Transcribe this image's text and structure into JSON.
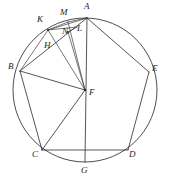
{
  "figure": {
    "width": 171,
    "height": 186,
    "background_color": "#ffffff",
    "stroke_color": "#2b2b2b",
    "circle_color": "#3a3a3a"
  },
  "circle": {
    "name": "circumscribed-circle",
    "center_label": "F",
    "cx": 85,
    "cy": 90,
    "r": 72
  },
  "labels": {
    "A": "A",
    "B": "B",
    "C": "C",
    "D": "D",
    "E": "E",
    "F": "F",
    "G": "G",
    "H": "H",
    "K": "K",
    "L": "L",
    "M": "M",
    "N": "N"
  },
  "points": [
    {
      "id": "A",
      "label": "A",
      "x": 87,
      "y": 18,
      "label_x": 87,
      "label_y": 5,
      "on_circle": true
    },
    {
      "id": "B",
      "label": "B",
      "x": 20,
      "y": 71,
      "label_x": 10,
      "label_y": 66,
      "on_circle": true
    },
    {
      "id": "C",
      "label": "C",
      "x": 42,
      "y": 150,
      "label_x": 34,
      "label_y": 153,
      "on_circle": true
    },
    {
      "id": "D",
      "label": "D",
      "x": 128,
      "y": 150,
      "label_x": 130,
      "label_y": 153,
      "on_circle": true
    },
    {
      "id": "E",
      "label": "E",
      "x": 149,
      "y": 72,
      "label_x": 152,
      "label_y": 67,
      "on_circle": true
    },
    {
      "id": "F",
      "label": "F",
      "x": 85,
      "y": 90,
      "label_x": 90,
      "label_y": 91,
      "on_circle": false
    },
    {
      "id": "G",
      "label": "G",
      "x": 85,
      "y": 162,
      "label_x": 82,
      "label_y": 167,
      "on_circle": true
    },
    {
      "id": "H",
      "label": "H",
      "x": 53,
      "y": 43,
      "label_x": 45,
      "label_y": 44,
      "on_circle": false
    },
    {
      "id": "K",
      "label": "K",
      "x": 48,
      "y": 30,
      "label_x": 39,
      "label_y": 18,
      "on_circle": true
    },
    {
      "id": "L",
      "label": "L",
      "x": 76,
      "y": 28,
      "label_x": 77,
      "label_y": 26,
      "on_circle": false
    },
    {
      "id": "M",
      "label": "M",
      "x": 68,
      "y": 22,
      "label_x": 62,
      "label_y": 11,
      "on_circle": true
    },
    {
      "id": "N",
      "label": "N",
      "x": 68,
      "y": 32,
      "label_x": 63,
      "label_y": 29,
      "on_circle": false
    }
  ],
  "segments": [
    {
      "name": "pentagon-side-ab",
      "from": "A",
      "to": "B"
    },
    {
      "name": "pentagon-side-bc",
      "from": "B",
      "to": "C"
    },
    {
      "name": "pentagon-side-cd",
      "from": "C",
      "to": "D"
    },
    {
      "name": "pentagon-side-de",
      "from": "D",
      "to": "E"
    },
    {
      "name": "pentagon-side-ea",
      "from": "E",
      "to": "A"
    },
    {
      "name": "diameter-ag",
      "from": "A",
      "to": "G"
    },
    {
      "name": "radius-fb",
      "from": "F",
      "to": "B"
    },
    {
      "name": "radius-fc",
      "from": "F",
      "to": "C"
    },
    {
      "name": "radius-fk",
      "from": "F",
      "to": "K"
    },
    {
      "name": "segment-fm",
      "from": "F",
      "to": "M"
    },
    {
      "name": "segment-fn",
      "from": "F",
      "to": "N"
    },
    {
      "name": "chord-bk",
      "from": "B",
      "to": "K"
    },
    {
      "name": "chord-ka",
      "from": "K",
      "to": "A"
    },
    {
      "name": "segment-km",
      "from": "K",
      "to": "M"
    },
    {
      "name": "segment-kl",
      "from": "K",
      "to": "L"
    },
    {
      "name": "segment-ma",
      "from": "M",
      "to": "A"
    },
    {
      "name": "segment-nl",
      "from": "N",
      "to": "L"
    }
  ]
}
